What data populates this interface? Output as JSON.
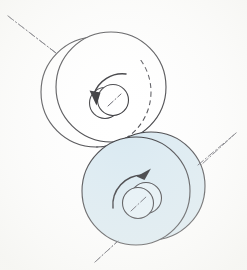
{
  "figure": {
    "title": "Two contacting rollers with opposite rotation",
    "background_color": "#fefefe",
    "width": 247,
    "height": 270,
    "line_color": "#3a3a3e",
    "accent_color": "#d9e9f1",
    "axis_color": "#5b5b64"
  },
  "upper_wheel": {
    "name": "upper-roller",
    "fill_color": "#ffffff",
    "outer_disc": {
      "cx": 111,
      "cy": 87,
      "r": 55
    },
    "rear_disc": {
      "cx": 96,
      "cy": 92,
      "r": 55
    },
    "hidden_disc": {
      "cx": 111,
      "cy": 87,
      "r": 55
    },
    "hub_front": {
      "cx": 113,
      "cy": 100,
      "r": 15.5
    },
    "hub_rear": {
      "cx": 105,
      "cy": 103,
      "r": 15.5
    },
    "rotation": "counterclockwise",
    "arrow_label": "rotation-arrow-upper"
  },
  "lower_wheel": {
    "name": "lower-roller",
    "fill_color": "#d9e9f1",
    "outer_disc": {
      "cx": 151,
      "cy": 186,
      "r": 54
    },
    "front_disc": {
      "cx": 136,
      "cy": 191,
      "r": 54
    },
    "hub_front": {
      "cx": 138,
      "cy": 203,
      "r": 15.5
    },
    "hub_rear": {
      "cx": 146,
      "cy": 198,
      "r": 15.5
    },
    "rotation": "clockwise",
    "arrow_label": "rotation-arrow-lower"
  },
  "axes": {
    "upper_axis": {
      "name": "upper-axis-centerline",
      "x1": 8,
      "y1": 16,
      "x2": 126,
      "y2": 107,
      "style": "dash-dot"
    },
    "lower_axis": {
      "name": "lower-axis-centerline",
      "x1": 95,
      "y1": 262,
      "x2": 236,
      "y2": 133,
      "style": "dash-dot"
    }
  }
}
